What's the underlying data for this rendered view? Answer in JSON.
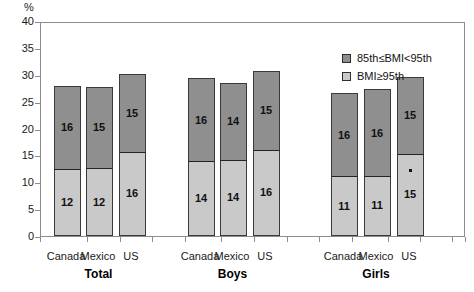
{
  "chart_data": {
    "type": "bar",
    "subtype": "stacked-bar",
    "title": "",
    "xlabel": "",
    "ylabel": "%",
    "ylim": [
      0,
      40
    ],
    "ytick_step": 5,
    "yticks": [
      "40",
      "35",
      "30",
      "25",
      "20",
      "15",
      "10",
      "5",
      "0"
    ],
    "grid": false,
    "legend_position": "top-right",
    "categories": [
      "Canada",
      "Mexico",
      "US",
      "Canada",
      "Mexico",
      "US",
      "Canada",
      "Mexico",
      "US"
    ],
    "groups": [
      "Total",
      "Boys",
      "Girls"
    ],
    "series": [
      {
        "name": "BMI≥95th",
        "color": "#c9c9c9",
        "values": [
          12,
          12,
          16,
          14,
          14,
          16,
          11,
          11,
          15
        ]
      },
      {
        "name": "85th≤BMI<95th",
        "color": "#8f8f8f",
        "values": [
          16,
          15,
          15,
          16,
          14,
          15,
          16,
          16,
          15
        ]
      }
    ],
    "totals": [
      28.0,
      27.8,
      30.2,
      29.4,
      28.5,
      30.7,
      26.6,
      27.3,
      29.6
    ],
    "annotations": [
      {
        "bar_index": 8,
        "segment": "BMI≥95th",
        "marker": "square-dot"
      }
    ]
  },
  "axis": {
    "unit_label": "%",
    "ticks": [
      {
        "label": "40",
        "value": 40
      },
      {
        "label": "35",
        "value": 35
      },
      {
        "label": "30",
        "value": 30
      },
      {
        "label": "25",
        "value": 25
      },
      {
        "label": "20",
        "value": 20
      },
      {
        "label": "15",
        "value": 15
      },
      {
        "label": "10",
        "value": 10
      },
      {
        "label": "5",
        "value": 5
      },
      {
        "label": "0",
        "value": 0
      }
    ]
  },
  "legend": {
    "items": [
      {
        "label": "85th≤BMI<95th",
        "swatch": "dark"
      },
      {
        "label": "BMI≥95th",
        "swatch": "light"
      }
    ]
  },
  "bars": [
    {
      "group": "Total",
      "country": "Canada",
      "low_label": "12",
      "high_label": "16",
      "low": 12.2,
      "high": 15.8,
      "total": 28.0,
      "marker": false
    },
    {
      "group": "Total",
      "country": "Mexico",
      "low_label": "12",
      "high_label": "15",
      "low": 12.4,
      "high": 15.4,
      "total": 27.8,
      "marker": false
    },
    {
      "group": "Total",
      "country": "US",
      "low_label": "16",
      "high_label": "15",
      "low": 15.5,
      "high": 14.7,
      "total": 30.2,
      "marker": false
    },
    {
      "group": "Boys",
      "country": "Canada",
      "low_label": "14",
      "high_label": "16",
      "low": 13.7,
      "high": 15.7,
      "total": 29.4,
      "marker": false
    },
    {
      "group": "Boys",
      "country": "Mexico",
      "low_label": "14",
      "high_label": "14",
      "low": 14.0,
      "high": 14.5,
      "total": 28.5,
      "marker": false
    },
    {
      "group": "Boys",
      "country": "US",
      "low_label": "16",
      "high_label": "15",
      "low": 15.9,
      "high": 14.8,
      "total": 30.7,
      "marker": false
    },
    {
      "group": "Girls",
      "country": "Canada",
      "low_label": "11",
      "high_label": "16",
      "low": 10.9,
      "high": 15.7,
      "total": 26.6,
      "marker": false
    },
    {
      "group": "Girls",
      "country": "Mexico",
      "low_label": "11",
      "high_label": "16",
      "low": 11.0,
      "high": 16.3,
      "total": 27.3,
      "marker": false
    },
    {
      "group": "Girls",
      "country": "US",
      "low_label": "15",
      "high_label": "15",
      "low": 15.1,
      "high": 14.5,
      "total": 29.6,
      "marker": true
    }
  ],
  "group_labels": [
    "Total",
    "Boys",
    "Girls"
  ],
  "colors": {
    "dark_segment": "#8f8f8f",
    "light_segment": "#c9c9c9",
    "axis": "#8c8c8c",
    "text": "#1a1a1a",
    "background": "#ffffff"
  }
}
